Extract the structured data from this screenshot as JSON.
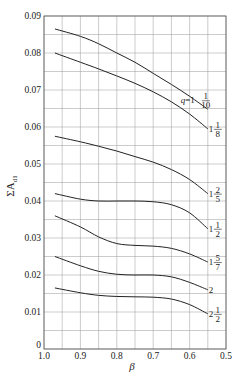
{
  "chart_data": {
    "type": "line",
    "title": "",
    "xlabel": "β",
    "ylabel": "ΣA_d1",
    "xlim": [
      1.0,
      0.5
    ],
    "ylim": [
      0,
      0.09
    ],
    "x_reversed": true,
    "grid": true,
    "legend_position": "inline-right",
    "x_ticks": [
      "1.0",
      "0.9",
      "0.8",
      "0.7",
      "0.6",
      "0.5"
    ],
    "y_ticks": [
      "0",
      "0.01",
      "0.02",
      "0.03",
      "0.04",
      "0.05",
      "0.06",
      "0.07",
      "0.08",
      "0.09"
    ],
    "x": [
      0.97,
      0.9,
      0.85,
      0.8,
      0.75,
      0.7,
      0.65,
      0.6,
      0.55
    ],
    "series": [
      {
        "name": "q=1 1/10",
        "label_main": "q=1",
        "frac_num": "1",
        "frac_den": "10",
        "values": [
          0.0865,
          0.0845,
          0.0825,
          0.08,
          0.0775,
          0.0745,
          0.0715,
          0.0683,
          0.0648
        ]
      },
      {
        "name": "1 1/8",
        "label_main": "1",
        "frac_num": "1",
        "frac_den": "8",
        "values": [
          0.08,
          0.0775,
          0.0757,
          0.0738,
          0.0718,
          0.0695,
          0.0668,
          0.0635,
          0.0595
        ]
      },
      {
        "name": "1 2/5",
        "label_main": "1",
        "frac_num": "2",
        "frac_den": "5",
        "values": [
          0.0575,
          0.056,
          0.0548,
          0.0535,
          0.052,
          0.0505,
          0.0485,
          0.0458,
          0.042
        ]
      },
      {
        "name": "1 1/2",
        "label_main": "1",
        "frac_num": "1",
        "frac_den": "2",
        "values": [
          0.042,
          0.0405,
          0.04,
          0.04,
          0.04,
          0.0398,
          0.039,
          0.0368,
          0.0325
        ]
      },
      {
        "name": "1 5/7",
        "label_main": "1",
        "frac_num": "5",
        "frac_den": "7",
        "values": [
          0.036,
          0.033,
          0.0303,
          0.0285,
          0.028,
          0.0278,
          0.0272,
          0.0257,
          0.0235
        ]
      },
      {
        "name": "2",
        "label_main": "2",
        "frac_num": "",
        "frac_den": "",
        "values": [
          0.025,
          0.0225,
          0.021,
          0.0202,
          0.02,
          0.02,
          0.0195,
          0.018,
          0.016
        ]
      },
      {
        "name": "2 1/2",
        "label_main": "2",
        "frac_num": "1",
        "frac_den": "2",
        "values": [
          0.0165,
          0.0152,
          0.0145,
          0.0142,
          0.0141,
          0.014,
          0.0135,
          0.012,
          0.0095
        ]
      }
    ]
  }
}
